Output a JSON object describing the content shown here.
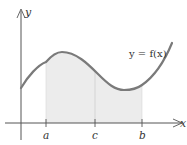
{
  "diagram": {
    "function_label": "y = f(x)",
    "axis_labels": {
      "x": "x",
      "y": "y"
    },
    "tick_labels": {
      "a": "a",
      "c": "c",
      "b": "b"
    },
    "colors": {
      "curve": "#7a7a7a",
      "axis": "#555555",
      "shade": "#ececec",
      "text": "#333333"
    }
  }
}
